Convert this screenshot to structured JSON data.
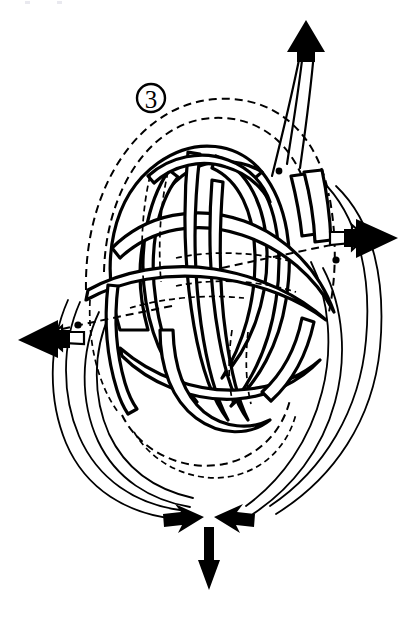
{
  "figure": {
    "step_label": "3",
    "step_label_style": "circled-number",
    "background_color": "#ffffff",
    "ink_color": "#000000",
    "line_style_visible": "solid",
    "line_style_hidden": "dashed"
  },
  "annotations": {
    "markers": [
      {
        "name": "left-marker-dot",
        "x": 78,
        "y": 325
      },
      {
        "name": "right-marker-dot",
        "x": 336,
        "y": 260
      },
      {
        "name": "upper-right-marker-dot",
        "x": 279,
        "y": 171
      }
    ],
    "arrows": [
      {
        "name": "top-arrow",
        "label": "",
        "direction": "up",
        "style": "solid-filled",
        "tip_x": 306,
        "tip_y": 22
      },
      {
        "name": "right-arrow",
        "label": "",
        "direction": "right",
        "style": "solid-filled-with-outline-band",
        "tip_x": 396,
        "tip_y": 238
      },
      {
        "name": "left-arrow",
        "label": "",
        "direction": "left",
        "style": "solid-filled-with-outline-band",
        "tip_x": 20,
        "tip_y": 340
      },
      {
        "name": "bottom-left-converging-arrow",
        "label": "",
        "direction": "right",
        "style": "solid-filled",
        "tip_x": 205,
        "tip_y": 518
      },
      {
        "name": "bottom-right-converging-arrow",
        "label": "",
        "direction": "left",
        "style": "solid-filled",
        "tip_x": 213,
        "tip_y": 518
      },
      {
        "name": "bottom-down-arrow",
        "label": "",
        "direction": "down",
        "style": "thin-solid-filled",
        "tip_x": 209,
        "tip_y": 588
      }
    ]
  },
  "legend": {
    "visible": false,
    "entries": []
  },
  "caption": {
    "text": ""
  }
}
